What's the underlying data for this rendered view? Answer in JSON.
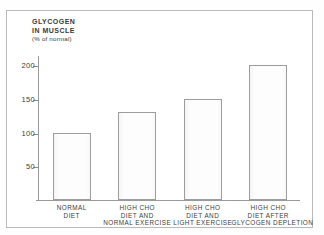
{
  "figure": {
    "title_lines": [
      "GLYCOGEN",
      "IN  MUSCLE"
    ],
    "units_line": "(% of normal)",
    "frame_color": "#b9b9b9",
    "axis_color": "#9a9a9a",
    "bar_outline_color": "#9d9d9d",
    "bar_fill_color": "#fdfdfd",
    "background_color": "#ffffff"
  },
  "chart_data": {
    "type": "bar",
    "title": "GLYCOGEN IN MUSCLE (% of normal)",
    "xlabel": "",
    "ylabel": "GLYCOGEN IN MUSCLE (% of normal)",
    "ylim": [
      0,
      215
    ],
    "yticks": [
      50,
      100,
      150,
      200
    ],
    "ytick_labels": [
      "50",
      "100",
      "150",
      "200"
    ],
    "grid": false,
    "legend": null,
    "categories": [
      "NORMAL DIET",
      "HIGH CHO DIET AND NORMAL EXERCISE",
      "HIGH CHO DIET AND LIGHT EXERCISE",
      "HIGH CHO DIET AFTER GLYCOGEN DEPLETION"
    ],
    "category_label_lines": [
      [
        "NORMAL",
        "DIET"
      ],
      [
        "HIGH CHO",
        "DIET AND",
        "NORMAL EXERCISE"
      ],
      [
        "HIGH CHO",
        "DIET AND",
        "LIGHT EXERCISE"
      ],
      [
        "HIGH CHO",
        "DIET AFTER",
        "GLYCOGEN DEPLETION"
      ]
    ],
    "values": [
      100,
      130,
      150,
      200
    ]
  }
}
